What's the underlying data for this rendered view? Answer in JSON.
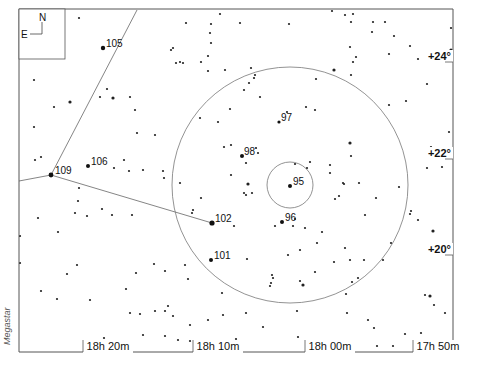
{
  "chart_data": {
    "type": "scatter",
    "title": "",
    "credit": "Megastar",
    "compass": {
      "north": "N",
      "east": "E"
    },
    "frame": {
      "left": 19,
      "top": 9,
      "right": 453,
      "bottom": 352
    },
    "x_ticks": [
      {
        "label": "18h 20m",
        "x": 108
      },
      {
        "label": "18h 10m",
        "x": 218
      },
      {
        "label": "18h 00m",
        "x": 330
      },
      {
        "label": "17h 50m",
        "x": 438
      }
    ],
    "y_ticks": [
      {
        "label": "+24°",
        "y": 60
      },
      {
        "label": "+22°",
        "y": 157
      },
      {
        "label": "+20°",
        "y": 253
      }
    ],
    "circles": [
      {
        "cx": 290,
        "cy": 185,
        "r": 118
      },
      {
        "cx": 290,
        "cy": 185,
        "r": 23
      }
    ],
    "lines": [
      {
        "points": [
          [
            19,
            181
          ],
          [
            51,
            175
          ],
          [
            137,
            10
          ]
        ]
      },
      {
        "points": [
          [
            51,
            175
          ],
          [
            212,
            223
          ]
        ]
      }
    ],
    "labeled_stars": [
      {
        "label": "105",
        "x": 103,
        "y": 48,
        "r": 2.2,
        "lx": 106,
        "ly": 47
      },
      {
        "label": "109",
        "x": 51,
        "y": 175,
        "r": 2.4,
        "lx": 55,
        "ly": 174
      },
      {
        "label": "106",
        "x": 88,
        "y": 166,
        "r": 2.0,
        "lx": 91,
        "ly": 165
      },
      {
        "label": "98",
        "x": 242,
        "y": 156,
        "r": 2.0,
        "lx": 244,
        "ly": 155
      },
      {
        "label": "97",
        "x": 279,
        "y": 122,
        "r": 1.6,
        "lx": 281,
        "ly": 121
      },
      {
        "label": "95",
        "x": 290,
        "y": 186,
        "r": 2.0,
        "lx": 293,
        "ly": 185
      },
      {
        "label": "96",
        "x": 282,
        "y": 222,
        "r": 2.0,
        "lx": 285,
        "ly": 221
      },
      {
        "label": "102",
        "x": 212,
        "y": 223,
        "r": 2.6,
        "lx": 215,
        "ly": 222
      },
      {
        "label": "101",
        "x": 211,
        "y": 260,
        "r": 2.0,
        "lx": 214,
        "ly": 259
      }
    ],
    "stars": [
      [
        79,
        18,
        1.1
      ],
      [
        220,
        14,
        1.1
      ],
      [
        186,
        23,
        1.1
      ],
      [
        211,
        24,
        1.1
      ],
      [
        210,
        33,
        1.1
      ],
      [
        211,
        43,
        1.1
      ],
      [
        171,
        50,
        1.1
      ],
      [
        173,
        48,
        1.1
      ],
      [
        201,
        62,
        1.1
      ],
      [
        208,
        56,
        1.1
      ],
      [
        208,
        71,
        1.1
      ],
      [
        176,
        63,
        1.1
      ],
      [
        183,
        63,
        1.1
      ],
      [
        180,
        62,
        1.1
      ],
      [
        240,
        23,
        1.1
      ],
      [
        289,
        24,
        1.1
      ],
      [
        332,
        11,
        1.1
      ],
      [
        353,
        14,
        1.1
      ],
      [
        351,
        22,
        1.1
      ],
      [
        345,
        15,
        1.1
      ],
      [
        373,
        22,
        1.1
      ],
      [
        385,
        22,
        1.1
      ],
      [
        372,
        32,
        1.1
      ],
      [
        394,
        36,
        1.1
      ],
      [
        410,
        46,
        1.1
      ],
      [
        350,
        47,
        1.1
      ],
      [
        356,
        57,
        1.1
      ],
      [
        353,
        62,
        1.1
      ],
      [
        389,
        54,
        1.1
      ],
      [
        418,
        59,
        1.1
      ],
      [
        438,
        56,
        1.1
      ],
      [
        451,
        50,
        1.6
      ],
      [
        451,
        28,
        1.1
      ],
      [
        334,
        70,
        1.6
      ],
      [
        351,
        75,
        1.1
      ],
      [
        427,
        84,
        1.1
      ],
      [
        406,
        101,
        1.1
      ],
      [
        389,
        105,
        1.1
      ],
      [
        251,
        68,
        1.1
      ],
      [
        255,
        75,
        1.1
      ],
      [
        254,
        78,
        1.1
      ],
      [
        249,
        83,
        1.1
      ],
      [
        225,
        70,
        1.1
      ],
      [
        316,
        79,
        1.1
      ],
      [
        315,
        110,
        1.1
      ],
      [
        244,
        90,
        1.1
      ],
      [
        260,
        97,
        1.1
      ],
      [
        230,
        109,
        1.1
      ],
      [
        306,
        107,
        1.1
      ],
      [
        287,
        112,
        1.1
      ],
      [
        200,
        118,
        1.1
      ],
      [
        218,
        122,
        1.1
      ],
      [
        256,
        148,
        1.1
      ],
      [
        258,
        153,
        1.1
      ],
      [
        224,
        147,
        1.1
      ],
      [
        231,
        145,
        1.1
      ],
      [
        350,
        143,
        1.6
      ],
      [
        351,
        156,
        1.1
      ],
      [
        310,
        162,
        1.1
      ],
      [
        307,
        168,
        1.1
      ],
      [
        330,
        165,
        1.1
      ],
      [
        344,
        184,
        1.1
      ],
      [
        359,
        183,
        1.1
      ],
      [
        376,
        198,
        1.1
      ],
      [
        399,
        187,
        1.1
      ],
      [
        411,
        211,
        1.1
      ],
      [
        410,
        214,
        1.1
      ],
      [
        418,
        220,
        1.1
      ],
      [
        433,
        231,
        1.6
      ],
      [
        449,
        132,
        1.1
      ],
      [
        458,
        134,
        1.1
      ],
      [
        431,
        147,
        1.1
      ],
      [
        442,
        167,
        1.1
      ],
      [
        427,
        168,
        1.1
      ],
      [
        295,
        164,
        1.1
      ],
      [
        330,
        173,
        1.1
      ],
      [
        335,
        199,
        1.1
      ],
      [
        339,
        196,
        1.1
      ],
      [
        343,
        183,
        1.1
      ],
      [
        246,
        163,
        1.1
      ],
      [
        231,
        175,
        1.1
      ],
      [
        248,
        184,
        1.6
      ],
      [
        244,
        193,
        1.1
      ],
      [
        246,
        195,
        1.1
      ],
      [
        252,
        193,
        1.1
      ],
      [
        201,
        198,
        1.1
      ],
      [
        192,
        213,
        1.1
      ],
      [
        234,
        226,
        1.1
      ],
      [
        275,
        226,
        1.1
      ],
      [
        305,
        228,
        1.1
      ],
      [
        295,
        219,
        1.1
      ],
      [
        322,
        232,
        1.1
      ],
      [
        317,
        243,
        1.1
      ],
      [
        300,
        250,
        1.1
      ],
      [
        293,
        226,
        1.1
      ],
      [
        34,
        127,
        1.1
      ],
      [
        35,
        160,
        1.1
      ],
      [
        41,
        157,
        1.1
      ],
      [
        70,
        102,
        1.6
      ],
      [
        54,
        107,
        1.1
      ],
      [
        34,
        80,
        1.1
      ],
      [
        113,
        98,
        1.6
      ],
      [
        100,
        97,
        1.1
      ],
      [
        107,
        89,
        1.1
      ],
      [
        130,
        97,
        1.1
      ],
      [
        135,
        110,
        1.1
      ],
      [
        137,
        133,
        1.1
      ],
      [
        155,
        135,
        1.1
      ],
      [
        124,
        160,
        1.1
      ],
      [
        114,
        168,
        1.1
      ],
      [
        143,
        170,
        1.1
      ],
      [
        129,
        171,
        1.1
      ],
      [
        163,
        171,
        1.1
      ],
      [
        164,
        178,
        1.1
      ],
      [
        180,
        183,
        1.1
      ],
      [
        193,
        210,
        1.1
      ],
      [
        79,
        188,
        1.1
      ],
      [
        78,
        201,
        1.1
      ],
      [
        75,
        213,
        1.1
      ],
      [
        58,
        232,
        1.1
      ],
      [
        87,
        216,
        1.1
      ],
      [
        102,
        209,
        1.1
      ],
      [
        112,
        215,
        1.1
      ],
      [
        132,
        215,
        1.1
      ],
      [
        38,
        218,
        1.1
      ],
      [
        20,
        236,
        1.1
      ],
      [
        20,
        263,
        1.1
      ],
      [
        41,
        291,
        1.1
      ],
      [
        57,
        299,
        1.1
      ],
      [
        67,
        274,
        1.1
      ],
      [
        77,
        265,
        1.1
      ],
      [
        90,
        300,
        1.1
      ],
      [
        104,
        338,
        1.1
      ],
      [
        126,
        289,
        1.1
      ],
      [
        136,
        273,
        1.1
      ],
      [
        140,
        314,
        1.1
      ],
      [
        143,
        335,
        1.1
      ],
      [
        130,
        313,
        1.1
      ],
      [
        154,
        264,
        1.1
      ],
      [
        165,
        271,
        1.1
      ],
      [
        185,
        265,
        1.1
      ],
      [
        188,
        279,
        1.1
      ],
      [
        173,
        316,
        1.1
      ],
      [
        190,
        325,
        1.1
      ],
      [
        190,
        341,
        1.1
      ],
      [
        208,
        320,
        1.1
      ],
      [
        223,
        315,
        1.1
      ],
      [
        222,
        293,
        1.1
      ],
      [
        247,
        259,
        1.1
      ],
      [
        272,
        275,
        1.1
      ],
      [
        273,
        278,
        1.1
      ],
      [
        271,
        283,
        1.1
      ],
      [
        270,
        286,
        1.1
      ],
      [
        288,
        255,
        1.1
      ],
      [
        300,
        281,
        1.1
      ],
      [
        303,
        285,
        1.6
      ],
      [
        297,
        311,
        1.1
      ],
      [
        263,
        327,
        1.1
      ],
      [
        298,
        337,
        1.1
      ],
      [
        236,
        339,
        1.1
      ],
      [
        236,
        350,
        1.1
      ],
      [
        246,
        313,
        1.1
      ],
      [
        165,
        336,
        1.1
      ],
      [
        178,
        340,
        1.1
      ],
      [
        155,
        311,
        1.1
      ],
      [
        168,
        306,
        1.1
      ],
      [
        165,
        311,
        1.1
      ],
      [
        209,
        345,
        1.1
      ],
      [
        345,
        248,
        1.1
      ],
      [
        350,
        260,
        1.1
      ],
      [
        352,
        282,
        1.1
      ],
      [
        358,
        278,
        1.1
      ],
      [
        364,
        260,
        1.1
      ],
      [
        346,
        294,
        1.1
      ],
      [
        347,
        313,
        1.1
      ],
      [
        368,
        320,
        1.1
      ],
      [
        374,
        328,
        1.1
      ],
      [
        377,
        346,
        1.1
      ],
      [
        393,
        346,
        1.1
      ],
      [
        405,
        334,
        1.1
      ],
      [
        425,
        295,
        1.1
      ],
      [
        430,
        296,
        1.6
      ],
      [
        434,
        305,
        1.1
      ],
      [
        445,
        313,
        1.1
      ],
      [
        434,
        345,
        1.1
      ],
      [
        421,
        333,
        1.1
      ],
      [
        455,
        292,
        1.1
      ],
      [
        383,
        260,
        1.1
      ],
      [
        365,
        215,
        1.1
      ],
      [
        334,
        262,
        1.1
      ],
      [
        315,
        272,
        1.1
      ],
      [
        391,
        243,
        1.1
      ]
    ]
  }
}
